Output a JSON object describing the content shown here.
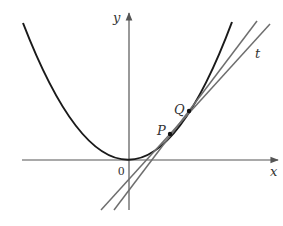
{
  "figure": {
    "labels": {
      "y_axis": "y",
      "x_axis": "x",
      "origin": "0",
      "point_p": "P",
      "point_q": "Q",
      "tangent": "t"
    },
    "colors": {
      "curve": "#1a1a1a",
      "axes": "#555555",
      "lines": "#6e6e6e",
      "text": "#333333"
    },
    "points": {
      "origin": [
        129,
        160
      ],
      "P": [
        170,
        134
      ],
      "Q": [
        189,
        111
      ]
    }
  }
}
